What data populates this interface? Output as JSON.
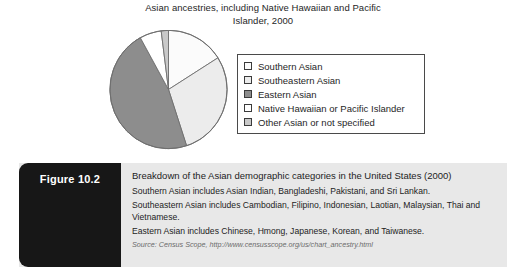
{
  "chart_data": {
    "type": "pie",
    "title": "Asian ancestries, including Native Hawaiian and Pacific Islander, 2000",
    "title_line1": "Asian ancestries, including Native Hawaiian and Pacific",
    "title_line2": "Islander, 2000",
    "categories": [
      "Southern Asian",
      "Southeastern Asian",
      "Eastern Asian",
      "Native Hawaiian or Pacific Islander",
      "Other Asian or not specified"
    ],
    "values": [
      16,
      29,
      47,
      6,
      2
    ],
    "colors": [
      "#fbfbfb",
      "#ececec",
      "#8d8d8d",
      "#ffffff",
      "#c9c9c9"
    ],
    "legend_position": "right",
    "xlabel": "",
    "ylabel": "",
    "grid": false
  },
  "legend": {
    "items": [
      {
        "label": "Southern Asian",
        "swatch": "#fbfbfb",
        "swatch_name": "legend-swatch-southern-asian"
      },
      {
        "label": "Southeastern Asian",
        "swatch": "#ececec",
        "swatch_name": "legend-swatch-southeastern-asian"
      },
      {
        "label": "Eastern Asian",
        "swatch": "#8d8d8d",
        "swatch_name": "legend-swatch-eastern-asian"
      },
      {
        "label": "Native Hawaiian or Pacific Islander",
        "swatch": "#ffffff",
        "swatch_name": "legend-swatch-native-hawaiian"
      },
      {
        "label": "Other Asian or not specified",
        "swatch": "#c9c9c9",
        "swatch_name": "legend-swatch-other-asian"
      }
    ]
  },
  "figure": {
    "tab_label": "Figure 10.2",
    "heading": "Breakdown of the Asian demographic categories in the United States (2000)",
    "notes": [
      "Southern Asian includes Asian Indian, Bangladeshi, Pakistani, and Sri Lankan.",
      "Southeastern Asian includes Cambodian, Filipino, Indonesian, Laotian, Malaysian, Thai and Vietnamese.",
      "Eastern Asian includes Chinese, Hmong, Japanese, Korean, and Taiwanese."
    ],
    "source": "Source: Census Scope, http://www.censusscope.org/us/chart_ancestry.html"
  }
}
